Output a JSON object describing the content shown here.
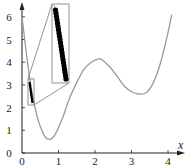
{
  "chart_data": {
    "type": "line",
    "title": "",
    "xlabel": "x",
    "ylabel": "",
    "xlim": [
      0,
      4.3
    ],
    "ylim": [
      0,
      6.5
    ],
    "x_ticks": [
      "0",
      "1",
      "2",
      "3",
      "4"
    ],
    "y_ticks": [
      "0",
      "1",
      "2",
      "3",
      "4",
      "5",
      "6"
    ],
    "grid": false,
    "legend": null,
    "series": [
      {
        "name": "curve",
        "color": "#9a9a9a",
        "x": [
          0.0,
          0.2,
          0.4,
          0.6,
          0.75,
          0.9,
          1.1,
          1.3,
          1.5,
          1.7,
          1.9,
          2.1,
          2.2,
          2.4,
          2.6,
          2.8,
          3.0,
          3.2,
          3.4,
          3.6,
          3.8,
          4.0,
          4.1
        ],
        "y": [
          6.0,
          3.4,
          1.7,
          0.8,
          0.6,
          0.8,
          1.5,
          2.4,
          3.1,
          3.7,
          4.0,
          4.15,
          4.1,
          3.8,
          3.4,
          2.95,
          2.7,
          2.6,
          2.65,
          3.1,
          4.0,
          5.3,
          6.1
        ]
      },
      {
        "name": "highlighted-points",
        "color": "#000000",
        "marker": "circle",
        "x": [
          0.2,
          0.21,
          0.22,
          0.23,
          0.24,
          0.25,
          0.26,
          0.27,
          0.28,
          0.29,
          0.3
        ],
        "y": [
          3.4,
          3.25,
          3.1,
          2.95,
          2.8,
          2.65,
          2.5,
          2.4,
          2.3,
          2.2,
          2.1
        ]
      }
    ],
    "annotations": [
      {
        "type": "zoom-box-small",
        "x_range": [
          0.17,
          0.33
        ],
        "y_range": [
          2.05,
          3.5
        ]
      },
      {
        "type": "zoom-inset",
        "description": "magnified view of the highlighted points on the descending branch"
      }
    ]
  }
}
